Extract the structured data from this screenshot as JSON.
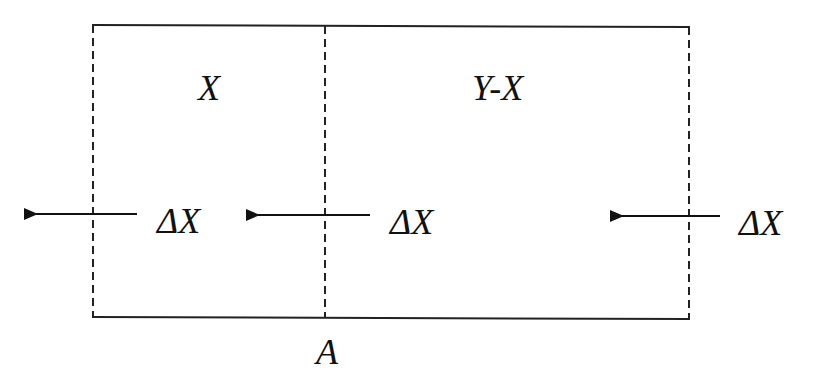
{
  "diagram": {
    "regions": [
      {
        "id": "left",
        "label": "X"
      },
      {
        "id": "right",
        "label": "Y-X"
      }
    ],
    "boundary_label": "A",
    "flows": [
      {
        "label": "ΔX",
        "direction": "left",
        "position": "outer-left boundary"
      },
      {
        "label": "ΔX",
        "direction": "left",
        "position": "middle boundary A"
      },
      {
        "label": "ΔX",
        "direction": "left",
        "position": "outer-right boundary"
      }
    ],
    "colors": {
      "line": "#111111",
      "background": "#ffffff"
    }
  }
}
